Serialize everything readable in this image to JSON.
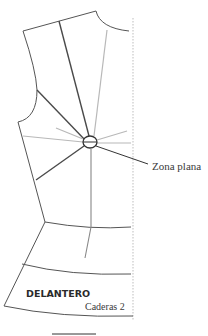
{
  "diagram": {
    "labels": {
      "flat_zone": "Zona plana",
      "piece_name": "DELANTERO",
      "size_line": "Caderas 2"
    },
    "colors": {
      "outline": "#555555",
      "dart_dark": "#4a4a4a",
      "guide_light": "#b8b8b8",
      "fold_line": "#c8c8c8",
      "text": "#333333"
    }
  }
}
